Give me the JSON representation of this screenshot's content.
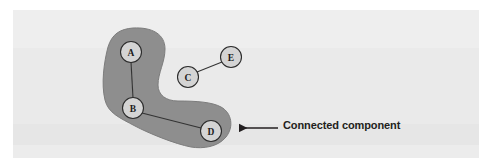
{
  "figure": {
    "caption_label": "Connected component",
    "background_color": "#ebebeb",
    "page_color": "#ffffff"
  },
  "diagram": {
    "type": "graph-with-highlighted-component",
    "blob": {
      "name": "connected-component-region",
      "fill_color": "#8e8e8e",
      "stroke_color": "#7c7c7c",
      "contains_nodes": [
        "A",
        "B",
        "D"
      ]
    },
    "nodes": [
      {
        "id": "A",
        "label": "A",
        "cx": 131,
        "cy": 52,
        "r": 10.5,
        "inside_component": true
      },
      {
        "id": "B",
        "label": "B",
        "cx": 133,
        "cy": 108,
        "r": 10.5,
        "inside_component": true
      },
      {
        "id": "C",
        "label": "C",
        "cx": 188,
        "cy": 77,
        "r": 10.5,
        "inside_component": false
      },
      {
        "id": "D",
        "label": "D",
        "cx": 211,
        "cy": 131,
        "r": 10.5,
        "inside_component": true
      },
      {
        "id": "E",
        "label": "E",
        "cx": 231,
        "cy": 57,
        "r": 10.5,
        "inside_component": false
      }
    ],
    "edges": [
      {
        "from": "A",
        "to": "B"
      },
      {
        "from": "B",
        "to": "D"
      },
      {
        "from": "C",
        "to": "E"
      }
    ],
    "node_fill_color": "#d4d4d4",
    "node_stroke_color": "#2b2b2b",
    "edge_color": "#333333",
    "arrow": {
      "name": "annotation-arrow",
      "from_x": 278,
      "from_y": 128,
      "to_x": 236,
      "to_y": 128,
      "color": "#231f20"
    }
  }
}
